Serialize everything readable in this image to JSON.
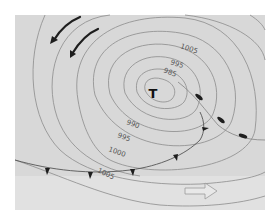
{
  "map": {
    "type": "weather-chart",
    "background": "#d9d9d9",
    "lower_band": "#e2e2e2",
    "isobar_color": "#8a8a8a",
    "front_color": "#222222",
    "pressure_center": {
      "label": "T",
      "meaning": "low pressure"
    },
    "isobar_labels": {
      "top_1005": "1005",
      "top_995": "995",
      "top_985": "985",
      "bottom_990": "990",
      "bottom_995": "995",
      "bottom_1000": "1000",
      "bottom_1005": "1005"
    },
    "wind_arrows": 2,
    "movement_arrow": "east"
  }
}
